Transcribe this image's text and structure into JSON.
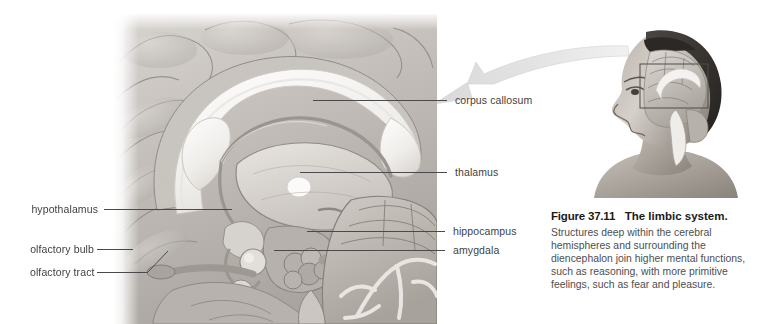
{
  "figure": {
    "number_label": "Figure 37.11",
    "title": "The limbic system.",
    "body": "Structures deep within the cerebral hemispheres and surrounding the diencephalon join higher mental functions, such as reasoning, with more primitive feelings, such as fear and pleasure."
  },
  "labels": {
    "corpus_callosum": "corpus callosum",
    "thalamus": "thalamus",
    "hippocampus": "hippocampus",
    "amygdala": "amygdala",
    "hypothalamus": "hypothalamus",
    "olfactory_bulb": "olfactory bulb",
    "olfactory_tract": "olfactory tract"
  },
  "images": {
    "sagittal_brain_alt": "Midsagittal section of the human brain showing limbic system structures",
    "head_profile_alt": "Profile of a human head with brain and a rectangular callout box over the limbic region",
    "callout_arrow_alt": "Curved magnification arrow pointing from the head callout box to the enlarged brain section"
  },
  "colors": {
    "label_text": "#3f3f42",
    "leader_line": "#4a4a4d",
    "caption_title": "#1a1a1a",
    "caption_body": "#4e4e51",
    "background": "#ffffff",
    "brain_light": "#f2f0ee",
    "brain_mid": "#b9b5b2",
    "brain_dark": "#7d7975"
  }
}
